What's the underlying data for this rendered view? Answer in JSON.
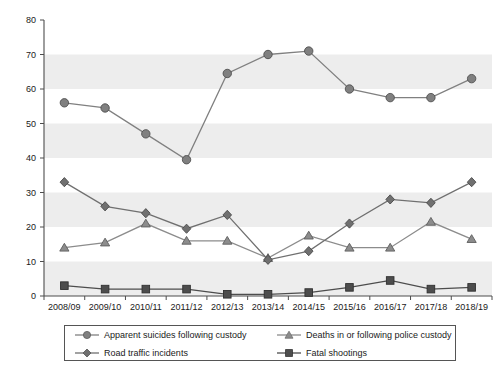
{
  "chart_data": {
    "type": "line",
    "title": "",
    "xlabel": "",
    "ylabel": "",
    "ylim": [
      0,
      80
    ],
    "ytick_step": 10,
    "yticks": [
      0,
      10,
      20,
      30,
      40,
      50,
      60,
      70,
      80
    ],
    "grid": "alternating horizontal shaded bands every 10 units",
    "legend_position": "bottom",
    "categories": [
      "2008/09",
      "2009/10",
      "2010/11",
      "2011/12",
      "2012/13",
      "2013/14",
      "2014/15",
      "2015/16",
      "2016/17",
      "2017/18",
      "2018/19"
    ],
    "series": [
      {
        "name": "Apparent suicides following custody",
        "marker": "circle",
        "color": "#808080",
        "values": [
          56,
          54.5,
          47,
          39.5,
          64.5,
          70,
          71,
          60,
          57.5,
          57.5,
          63
        ]
      },
      {
        "name": "Deaths in or following police custody",
        "marker": "triangle",
        "color": "#8c8c8c",
        "values": [
          14,
          15.5,
          21,
          16,
          16,
          11,
          17.5,
          14,
          14,
          21.5,
          16.5
        ]
      },
      {
        "name": "Road traffic incidents",
        "marker": "diamond",
        "color": "#707070",
        "values": [
          33,
          26,
          24,
          19.5,
          23.5,
          10.5,
          13,
          21,
          28,
          27,
          33
        ]
      },
      {
        "name": "Fatal shootings",
        "marker": "square",
        "color": "#4d4d4d",
        "values": [
          3,
          2,
          2,
          2,
          0.5,
          0.5,
          1,
          2.5,
          4.5,
          2,
          2.5
        ]
      }
    ]
  },
  "axis": {
    "y_ticks": [
      "0",
      "10",
      "20",
      "30",
      "40",
      "50",
      "60",
      "70",
      "80"
    ],
    "x_ticks": [
      "2008/09",
      "2009/10",
      "2010/11",
      "2011/12",
      "2012/13",
      "2013/14",
      "2014/15",
      "2015/16",
      "2016/17",
      "2017/18",
      "2018/19"
    ]
  },
  "legend": {
    "items": [
      {
        "label": "Apparent suicides following custody",
        "marker": "circle"
      },
      {
        "label": "Deaths in or following police custody",
        "marker": "triangle"
      },
      {
        "label": "Road traffic incidents",
        "marker": "diamond"
      },
      {
        "label": "Fatal shootings",
        "marker": "square"
      }
    ]
  },
  "colors": {
    "band": "#ededed",
    "axis": "#4d4d4d",
    "text": "#1a1a1a",
    "series_circle": "#808080",
    "series_triangle": "#8c8c8c",
    "series_diamond": "#707070",
    "series_square": "#4d4d4d"
  }
}
